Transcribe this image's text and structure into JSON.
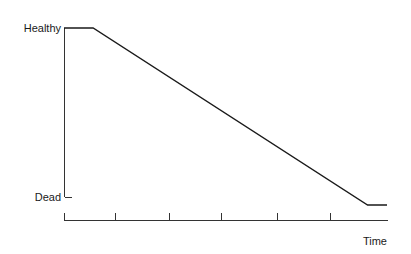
{
  "chart_data": {
    "type": "line",
    "title": "",
    "xlabel": "Time",
    "ylabel": "",
    "y_tick_labels": [
      "Healthy",
      "Dead"
    ],
    "x_tick_labels": [],
    "x_tick_count": 7,
    "grid": false,
    "legend": null,
    "series": [
      {
        "name": "health",
        "points": [
          {
            "x": 0.0,
            "y": 1.0
          },
          {
            "x": 0.09,
            "y": 1.0
          },
          {
            "x": 0.94,
            "y": 0.0
          },
          {
            "x": 1.0,
            "y": 0.0
          }
        ]
      }
    ],
    "xlim": [
      0,
      1
    ],
    "ylim": [
      0,
      1
    ]
  },
  "labels": {
    "y_top": "Healthy",
    "y_bottom": "Dead",
    "x_axis": "Time"
  },
  "colors": {
    "line": "#1a1a1a",
    "axis": "#333333",
    "background": "#ffffff"
  }
}
